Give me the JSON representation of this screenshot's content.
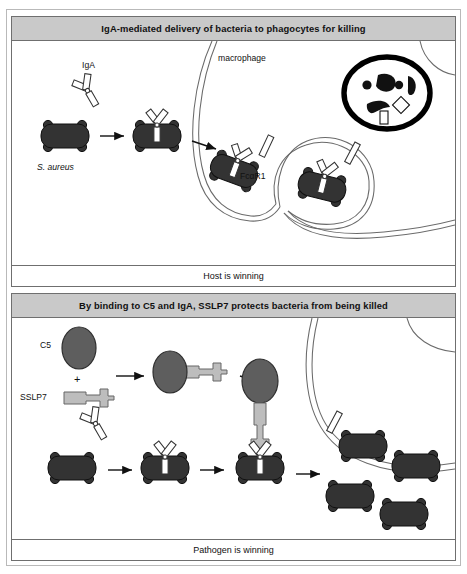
{
  "figure": {
    "panels": [
      {
        "id": "panel-host-winning",
        "header": "IgA-mediated delivery of bacteria to phagocytes for killing",
        "footer": "Host is winning",
        "labels": {
          "macrophage": "macrophage",
          "iga": "IgA",
          "bacterium": "S. aureus",
          "receptor": "FcαR1"
        },
        "steps": [
          "free S. aureus bacterium",
          "IgA antibody binds bacterium",
          "IgA-opsonised bacterium engages FcαR1 on macrophage",
          "bacterium engulfed into phagocytic cup",
          "bacterium degraded inside lysosome"
        ],
        "organelles": {
          "lysosome": "lysosome with degraded bacterial debris",
          "phagocytic_cup": "phagocytic cup engulfing bacterium"
        }
      },
      {
        "id": "panel-pathogen-winning",
        "header": "By binding to C5 and IgA, SSLP7 protects bacteria from being killed",
        "footer": "Pathogen is winning",
        "labels": {
          "c5": "C5",
          "plus": "+",
          "sslp7": "SSLP7"
        },
        "steps": [
          "C5 plus SSLP7",
          "SSLP7 binds C5",
          "C5–SSLP7 complex",
          "free S. aureus bacterium",
          "IgA binds bacterium",
          "C5–SSLP7 complex binds IgA blocking FcαR1 engagement",
          "bacteria survive and multiply"
        ]
      }
    ]
  },
  "colors": {
    "header_bg": "#c9c9c9",
    "panel_border": "#6f6f6f",
    "outer_frame": "#b9b9b9",
    "bacterium_fill": "#333333",
    "bacterium_stroke": "#111111",
    "c5_fill": "#5e5e5e",
    "c5_stroke": "#2f2f2f",
    "sslp7_fill": "#bdbdbd",
    "sslp7_stroke": "#666666",
    "antibody_fill": "#ffffff",
    "antibody_stroke": "#333333",
    "membrane_stroke": "#6a6a6a",
    "lysosome_stroke": "#000000",
    "text": "#111111"
  }
}
